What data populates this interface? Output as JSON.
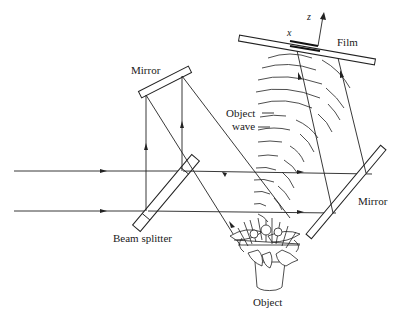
{
  "diagram": {
    "type": "optical-setup",
    "labels": {
      "mirror_top": "Mirror",
      "mirror_right": "Mirror",
      "beam_splitter": "Beam splitter",
      "object_wave": "Object\nwave",
      "object_wave_line1": "Object",
      "object_wave_line2": "wave",
      "film": "Film",
      "object": "Object",
      "axis_x": "x",
      "axis_z": "z"
    },
    "components": [
      {
        "id": "beam-splitter",
        "label": "Beam splitter"
      },
      {
        "id": "mirror-top",
        "label": "Mirror"
      },
      {
        "id": "mirror-right",
        "label": "Mirror"
      },
      {
        "id": "film",
        "label": "Film"
      },
      {
        "id": "object",
        "label": "Object"
      }
    ],
    "beams": [
      {
        "from": "source",
        "to": "beam-splitter",
        "count": 2,
        "direction": "right"
      },
      {
        "from": "beam-splitter",
        "to": "mirror-top",
        "direction": "up"
      },
      {
        "from": "mirror-top",
        "to": "object",
        "direction": "down-right"
      },
      {
        "from": "beam-splitter",
        "to": "mirror-right",
        "direction": "right"
      },
      {
        "from": "mirror-right",
        "to": "film",
        "direction": "up-left"
      },
      {
        "from": "object",
        "to": "film",
        "description": "Object wave (curved wavefronts)"
      }
    ],
    "colors": {
      "line": "#222222",
      "background": "#ffffff"
    }
  }
}
